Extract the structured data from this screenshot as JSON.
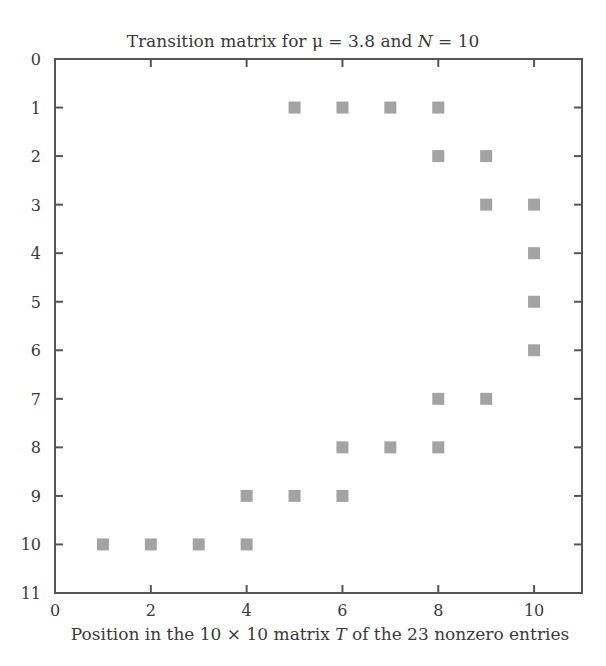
{
  "chart_data": {
    "type": "scatter",
    "title": "Transition matrix for μ = 3.8 and N = 10",
    "title_parts": {
      "prefix": "Transition matrix for μ = 3.8 and ",
      "italic": "N",
      "suffix": " = 10"
    },
    "xlabel": "Position in the 10 × 10 matrix T of the 23 nonzero entries",
    "xlabel_parts": {
      "prefix": "Position in the 10 × 10 matrix ",
      "italic": "T",
      "suffix": " of the 23 nonzero entries"
    },
    "ylabel": "",
    "xlim": [
      0,
      11
    ],
    "ylim": [
      11,
      0
    ],
    "y_inverted": true,
    "x_ticks": [
      0,
      2,
      4,
      6,
      8,
      10
    ],
    "y_ticks": [
      0,
      1,
      2,
      3,
      4,
      5,
      6,
      7,
      8,
      9,
      10,
      11
    ],
    "grid": false,
    "legend": null,
    "marker": {
      "shape": "square",
      "color": "#a3a3a3",
      "size": 12
    },
    "nonzero_count": 23,
    "points": [
      {
        "x": 5,
        "y": 1
      },
      {
        "x": 6,
        "y": 1
      },
      {
        "x": 7,
        "y": 1
      },
      {
        "x": 8,
        "y": 1
      },
      {
        "x": 8,
        "y": 2
      },
      {
        "x": 9,
        "y": 2
      },
      {
        "x": 9,
        "y": 3
      },
      {
        "x": 10,
        "y": 3
      },
      {
        "x": 10,
        "y": 4
      },
      {
        "x": 10,
        "y": 5
      },
      {
        "x": 10,
        "y": 6
      },
      {
        "x": 8,
        "y": 7
      },
      {
        "x": 9,
        "y": 7
      },
      {
        "x": 6,
        "y": 8
      },
      {
        "x": 7,
        "y": 8
      },
      {
        "x": 8,
        "y": 8
      },
      {
        "x": 4,
        "y": 9
      },
      {
        "x": 5,
        "y": 9
      },
      {
        "x": 6,
        "y": 9
      },
      {
        "x": 1,
        "y": 10
      },
      {
        "x": 2,
        "y": 10
      },
      {
        "x": 3,
        "y": 10
      },
      {
        "x": 4,
        "y": 10
      }
    ]
  },
  "colors": {
    "axis": "#555555",
    "marker": "#a3a3a3",
    "text": "#3a3a3a",
    "background": "#ffffff"
  }
}
